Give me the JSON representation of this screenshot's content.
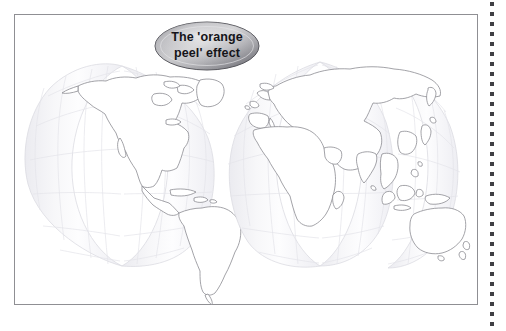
{
  "page": {
    "background_color": "#ffffff",
    "frame": {
      "name": "figure-frame",
      "border_color": "#8f8f93",
      "fill_color": "#ffffff"
    },
    "dotted_rule": {
      "name": "dotted-rule",
      "dot_color": "#3f3f44",
      "dot_count": 33,
      "dot_spacing_px": 10
    }
  },
  "callout": {
    "label_line1": "The 'orange",
    "label_line2": "peel' effect",
    "full_text": "The 'orange peel' effect",
    "text_color": "#15151a",
    "fill_light": "#d9d9db",
    "fill_mid": "#a9a9ad",
    "fill_dark": "#6e6e74",
    "border_color": "#55555b"
  },
  "map": {
    "title": "The 'orange peel' effect",
    "projection": "interrupted gores (orange peel)",
    "land_fill": "#ffffff",
    "ocean_fill": "#f4f4f6",
    "graticule_color": "#e2e2e8",
    "coastline_color": "#8c8c92",
    "gore_edge_color": "#dcdce2",
    "clusters": [
      {
        "name": "western-hemisphere",
        "label": "Americas",
        "gores": 2,
        "landmasses": [
          "North America",
          "Greenland",
          "Central America",
          "Caribbean",
          "South America"
        ]
      },
      {
        "name": "eastern-hemisphere",
        "label": "Eurasia, Africa, Oceania",
        "gores": 3,
        "landmasses": [
          "Europe",
          "Africa",
          "Asia",
          "Indonesia",
          "Japan",
          "Australia",
          "New Zealand",
          "Madagascar"
        ]
      }
    ]
  }
}
